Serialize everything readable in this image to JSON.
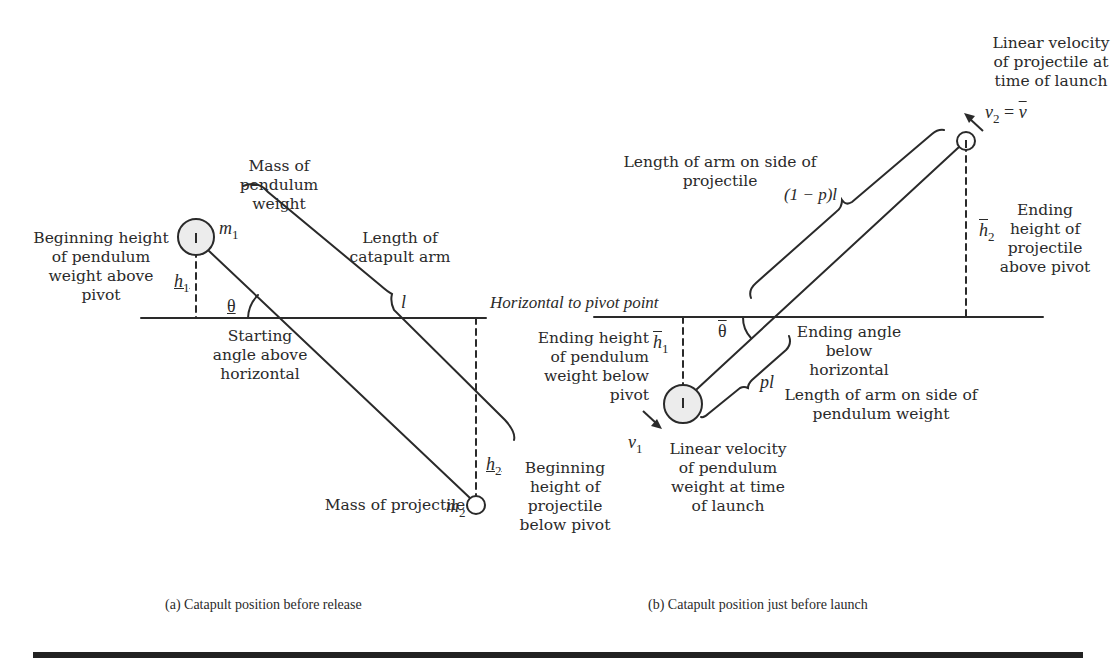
{
  "diagram": {
    "horizontal_label": "Horizontal to pivot point",
    "panel_a": {
      "caption": "(a) Catapult position before release",
      "labels": {
        "mass_pendulum": "Mass of pendulum\nweight",
        "begin_height_pendulum": "Beginning height\nof pendulum\nweight above\npivot",
        "length_arm": "Length of\ncatapult arm",
        "starting_angle": "Starting\nangle above\nhorizontal",
        "mass_projectile": "Mass of projectile",
        "begin_height_projectile": "Beginning\nheight of\nprojectile\nbelow pivot"
      },
      "symbols": {
        "m1": "m",
        "m1_sub": "1",
        "m2": "m",
        "m2_sub": "2",
        "h1": "h",
        "h1_sub": "1",
        "h2": "h",
        "h2_sub": "2",
        "theta": "θ",
        "l": "l"
      }
    },
    "panel_b": {
      "caption": "(b) Catapult position just before launch",
      "labels": {
        "linear_velocity_projectile": "Linear velocity\nof projectile at\ntime of launch",
        "length_arm_projectile": "Length of arm on side of\nprojectile",
        "ending_height_projectile": "Ending\nheight of\nprojectile\nabove pivot",
        "ending_height_pendulum": "Ending height\nof pendulum\nweight below\npivot",
        "ending_angle": "Ending angle\nbelow\nhorizontal",
        "length_arm_pendulum": "Length of arm on side of\npendulum weight",
        "linear_velocity_pendulum": "Linear velocity\nof pendulum\nweight at time\nof launch"
      },
      "symbols": {
        "v2": "v",
        "v2_sub": "2",
        "v2_eq": " = ",
        "v_bar": "v",
        "one_minus_p_l": "(1 − p)l",
        "h2bar": "h",
        "h2bar_sub": "2",
        "h1bar": "h",
        "h1bar_sub": "1",
        "theta_bar": "θ",
        "pl": "pl",
        "v1": "v",
        "v1_sub": "1"
      }
    }
  }
}
